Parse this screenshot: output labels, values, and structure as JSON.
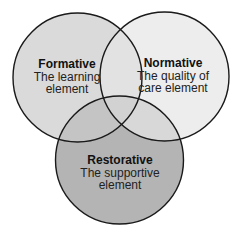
{
  "diagram": {
    "type": "venn",
    "sets": [
      {
        "id": "formative",
        "title": "Formative",
        "line1": "The learning",
        "line2": "element",
        "fill": "#dadada"
      },
      {
        "id": "normative",
        "title": "Normative",
        "line1": "The quality of",
        "line2": "care element",
        "fill": "#ededed"
      },
      {
        "id": "restorative",
        "title": "Restorative",
        "line1": "The supportive",
        "line2": "element",
        "fill": "#b4b4b4"
      }
    ],
    "overlap_colors": {
      "formative_normative": "#e2e2e2",
      "formative_restorative": "#c2c2c2",
      "normative_restorative": "#d6d6d6",
      "all": "#d0d0d0"
    },
    "stroke": "#1a1a1a"
  }
}
